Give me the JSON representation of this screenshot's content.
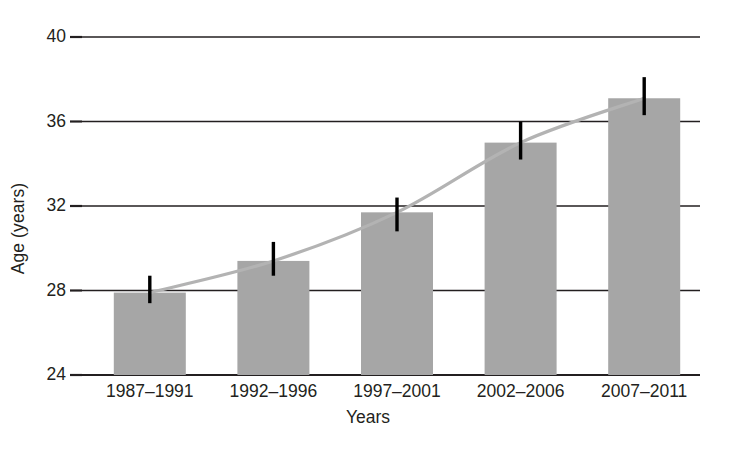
{
  "chart_data": {
    "type": "bar",
    "title": "",
    "subtitle": "",
    "xlabel": "Years",
    "ylabel": "Age (years)",
    "categories": [
      "1987–1991",
      "1992–1996",
      "1997–2001",
      "2002–2006",
      "2007–2011"
    ],
    "values": [
      27.9,
      29.4,
      31.7,
      35.0,
      37.1
    ],
    "error_low": [
      27.4,
      28.7,
      30.8,
      34.2,
      36.3
    ],
    "error_high": [
      28.7,
      30.3,
      32.4,
      36.0,
      38.1
    ],
    "series": [
      {
        "name": "Mean age",
        "kind": "bar",
        "values": [
          27.9,
          29.4,
          31.7,
          35.0,
          37.1
        ]
      },
      {
        "name": "Trend",
        "kind": "line",
        "values": [
          27.9,
          29.4,
          31.7,
          35.0,
          37.1
        ]
      }
    ],
    "ylim": [
      24,
      40
    ],
    "yticks": [
      24,
      28,
      32,
      36,
      40
    ],
    "ytick_labels": [
      "24",
      "28",
      "32",
      "36",
      "40"
    ],
    "grid": true,
    "grid_axis": "y",
    "legend": false,
    "legend_position": "none",
    "error_bars": true,
    "bar_color": "#a6a6a6",
    "line_color": "#b3b3b3",
    "axis_color": "#231f20",
    "grid_color": "#231f20",
    "error_bar_color": "#000000",
    "text_color": "#231f20"
  },
  "axes": {
    "y_title": "Age (years)",
    "x_title": "Years"
  }
}
